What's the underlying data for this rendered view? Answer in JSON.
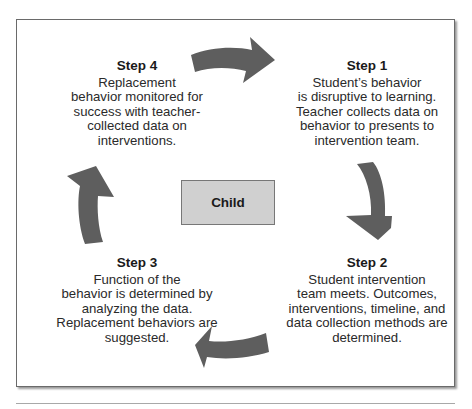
{
  "diagram": {
    "type": "cycle",
    "center": {
      "label": "Child"
    },
    "steps": [
      {
        "id": "step1",
        "title": "Step 1",
        "lines": [
          "Student’s behavior",
          "is disruptive to learning.",
          "Teacher collects data on",
          "behavior to presents to",
          "intervention team."
        ]
      },
      {
        "id": "step2",
        "title": "Step 2",
        "lines": [
          "Student intervention",
          "team meets. Outcomes,",
          "interventions, timeline, and",
          "data collection methods are",
          "determined."
        ]
      },
      {
        "id": "step3",
        "title": "Step 3",
        "lines": [
          "Function of the",
          "behavior is determined by",
          "analyzing the data.",
          "Replacement behaviors are",
          "suggested."
        ]
      },
      {
        "id": "step4",
        "title": "Step 4",
        "lines": [
          "Replacement",
          "behavior monitored for",
          "success with teacher-",
          "collected data on",
          "interventions."
        ]
      }
    ],
    "arrows": [
      {
        "from": "Step 4",
        "to": "Step 1",
        "direction": "right"
      },
      {
        "from": "Step 1",
        "to": "Step 2",
        "direction": "down"
      },
      {
        "from": "Step 2",
        "to": "Step 3",
        "direction": "left"
      },
      {
        "from": "Step 3",
        "to": "Step 4",
        "direction": "up"
      }
    ],
    "colors": {
      "arrow": "#5e5e5e",
      "center_fill": "#d0d0d0",
      "frame": "#6a6a6a"
    }
  }
}
